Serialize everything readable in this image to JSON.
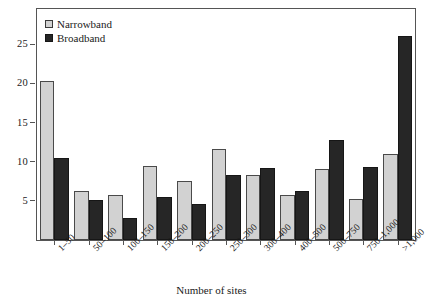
{
  "chart_data": {
    "type": "bar",
    "title": "",
    "subtitle": "",
    "xlabel": "Number of sites",
    "ylabel": "",
    "ylim": [
      0,
      29.5
    ],
    "yticks": [
      5,
      10,
      15,
      20,
      25
    ],
    "ytick_labels": [
      "5",
      "10",
      "15",
      "20",
      "25"
    ],
    "grid": false,
    "legend_position": "top-left",
    "categories": [
      "1–50",
      "50–100",
      "100–150",
      "150–200",
      "200–250",
      "250–300",
      "300–400",
      "400–500",
      "500–750",
      "750–1,000",
      ">1,000"
    ],
    "series": [
      {
        "name": "Narrowband",
        "color": "#d2d2d2",
        "values": [
          20.3,
          6.2,
          5.8,
          9.4,
          7.5,
          11.6,
          8.3,
          5.8,
          9.1,
          5.2,
          11.0
        ]
      },
      {
        "name": "Broadband",
        "color": "#262626",
        "values": [
          10.5,
          5.1,
          2.8,
          5.5,
          4.6,
          8.3,
          9.2,
          6.2,
          12.8,
          9.3,
          26.0
        ]
      }
    ]
  },
  "legend": {
    "items": [
      {
        "label": "Narrowband",
        "swatch": "light-square-swatch"
      },
      {
        "label": "Broadband",
        "swatch": "dark-square-swatch"
      }
    ]
  },
  "axis": {
    "x_title": "Number of sites"
  }
}
